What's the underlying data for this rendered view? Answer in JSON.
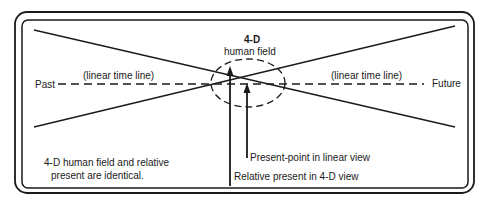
{
  "diagram": {
    "labels": {
      "past": "Past",
      "future": "Future",
      "linear_left": "(linear time line)",
      "linear_right": "(linear time line)",
      "field_title_1": "4-D",
      "field_title_2": "human field",
      "present_point": "Present-point in linear view",
      "relative_present": "Relative present in 4-D view",
      "note_1": "4-D human field and relative",
      "note_2": "present are identical."
    },
    "colors": {
      "ink": "#1a1a1a",
      "background": "#ffffff"
    }
  }
}
